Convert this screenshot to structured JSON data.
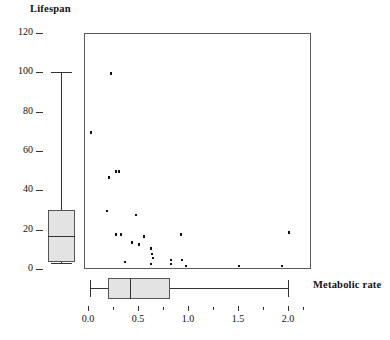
{
  "figure": {
    "type": "scatter-with-marginal-boxplots",
    "y_axis_title": "Lifespan",
    "x_axis_title": "Metabolic rate"
  },
  "chart_data": {
    "type": "scatter",
    "title": "",
    "xlabel": "Metabolic rate",
    "ylabel": "Lifespan",
    "xlim": [
      -0.08,
      2.2
    ],
    "ylim": [
      0,
      120
    ],
    "grid": false,
    "legend": null,
    "x_ticks_major": [
      0.0,
      0.5,
      1.0,
      1.5,
      2.0
    ],
    "x_tick_labels": [
      "0.0",
      "0.5",
      "1.0",
      "1.5",
      "2.0"
    ],
    "x_ticks_minor": [
      0.25,
      0.75,
      1.25,
      1.75,
      2.15
    ],
    "y_ticks_major": [
      0,
      20,
      40,
      60,
      80,
      100,
      120
    ],
    "y_tick_labels": [
      "0",
      "20",
      "40",
      "60",
      "80",
      "100",
      "120"
    ],
    "points": [
      {
        "x": 0.22,
        "y": 100
      },
      {
        "x": 0.02,
        "y": 70
      },
      {
        "x": 0.2,
        "y": 47
      },
      {
        "x": 0.27,
        "y": 50
      },
      {
        "x": 0.3,
        "y": 50
      },
      {
        "x": 0.18,
        "y": 30
      },
      {
        "x": 0.47,
        "y": 28
      },
      {
        "x": 0.27,
        "y": 18
      },
      {
        "x": 0.32,
        "y": 18
      },
      {
        "x": 0.43,
        "y": 14
      },
      {
        "x": 0.5,
        "y": 13
      },
      {
        "x": 0.55,
        "y": 17
      },
      {
        "x": 0.62,
        "y": 11
      },
      {
        "x": 0.63,
        "y": 8
      },
      {
        "x": 0.64,
        "y": 6
      },
      {
        "x": 0.62,
        "y": 3
      },
      {
        "x": 0.36,
        "y": 4
      },
      {
        "x": 0.92,
        "y": 18
      },
      {
        "x": 0.82,
        "y": 5
      },
      {
        "x": 0.82,
        "y": 3
      },
      {
        "x": 0.93,
        "y": 5
      },
      {
        "x": 0.97,
        "y": 2
      },
      {
        "x": 2.0,
        "y": 19
      },
      {
        "x": 1.5,
        "y": 2
      },
      {
        "x": 1.93,
        "y": 2
      }
    ],
    "boxplot_y": {
      "variable": "Lifespan",
      "orientation": "vertical",
      "whisker_low": 3,
      "q1": 3.5,
      "median": 17,
      "q3": 30,
      "whisker_high": 100
    },
    "boxplot_x": {
      "variable": "Metabolic rate",
      "orientation": "horizontal",
      "whisker_low": 0.02,
      "q1": 0.2,
      "median": 0.42,
      "q3": 0.82,
      "whisker_high": 2.0
    }
  }
}
